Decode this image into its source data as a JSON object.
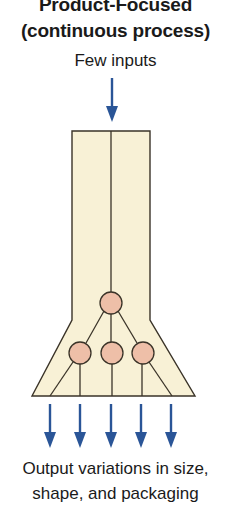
{
  "title": {
    "line1": "Product-Focused",
    "line2": "(continuous process)"
  },
  "input_label": "Few inputs",
  "output_label": {
    "line1": "Output variations in size,",
    "line2": "shape, and packaging"
  },
  "diagram": {
    "input_arrow_count": 1,
    "output_arrow_count": 5,
    "nodes": {
      "top": 1,
      "lower": 3
    }
  },
  "colors": {
    "arrow": "#2a5597",
    "shape_fill": "#f8f1d6",
    "node_fill": "#eebfa8",
    "stroke": "#3a3328",
    "text": "#1a1a1a"
  }
}
